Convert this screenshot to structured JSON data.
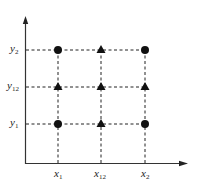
{
  "diagram": {
    "type": "grid-of-points",
    "axes": {
      "x_axis": "horizontal arrow",
      "y_axis": "vertical arrow"
    },
    "x_ticks": [
      {
        "id": "x1",
        "base": "x",
        "sub": "1"
      },
      {
        "id": "x12",
        "base": "x",
        "sub": "12"
      },
      {
        "id": "x2",
        "base": "x",
        "sub": "2"
      }
    ],
    "y_ticks": [
      {
        "id": "y2",
        "base": "y",
        "sub": "2"
      },
      {
        "id": "y12",
        "base": "y",
        "sub": "12"
      },
      {
        "id": "y1",
        "base": "y",
        "sub": "1"
      }
    ],
    "points": [
      {
        "x": "x1",
        "y": "y2",
        "marker": "circle"
      },
      {
        "x": "x12",
        "y": "y2",
        "marker": "triangle"
      },
      {
        "x": "x2",
        "y": "y2",
        "marker": "circle"
      },
      {
        "x": "x1",
        "y": "y12",
        "marker": "triangle"
      },
      {
        "x": "x12",
        "y": "y12",
        "marker": "triangle"
      },
      {
        "x": "x2",
        "y": "y12",
        "marker": "triangle"
      },
      {
        "x": "x1",
        "y": "y1",
        "marker": "circle"
      },
      {
        "x": "x12",
        "y": "y1",
        "marker": "triangle"
      },
      {
        "x": "x2",
        "y": "y1",
        "marker": "circle"
      }
    ],
    "colors": {
      "ink": "#111111",
      "axis": "#333333"
    }
  }
}
